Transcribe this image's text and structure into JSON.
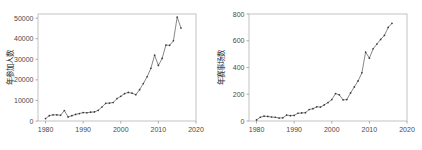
{
  "figure": {
    "background_color": "#ffffff",
    "line_color": "#555555",
    "frame_color": "#b4b4b4",
    "text_color": "#2b2b2b"
  },
  "chart_data": [
    {
      "type": "line",
      "panel": "left",
      "title": "",
      "xlabel": "",
      "ylabel": "年参加人数",
      "xlim": [
        1978,
        2020
      ],
      "ylim": [
        0,
        52000
      ],
      "xticks": [
        1980,
        1990,
        2000,
        2010,
        2020
      ],
      "yticks": [
        0,
        10000,
        20000,
        30000,
        40000,
        50000
      ],
      "xtick_labels": [
        "1980",
        "1990",
        "2000",
        "2010",
        "2020"
      ],
      "ytick_labels": [
        "0",
        "10000",
        "20000",
        "30000",
        "40000",
        "50000"
      ],
      "grid": false,
      "legend": "none",
      "markers": true,
      "x": [
        1980,
        1981,
        1982,
        1983,
        1984,
        1985,
        1986,
        1987,
        1988,
        1989,
        1990,
        1991,
        1992,
        1993,
        1994,
        1995,
        1996,
        1997,
        1998,
        1999,
        2000,
        2001,
        2002,
        2003,
        2004,
        2005,
        2006,
        2007,
        2008,
        2009,
        2010,
        2011,
        2012,
        2013,
        2014,
        2015,
        2016
      ],
      "values": [
        1200,
        2600,
        3000,
        3000,
        2800,
        5100,
        2000,
        2600,
        3200,
        3600,
        4100,
        4000,
        4300,
        4400,
        5200,
        6800,
        8600,
        8700,
        9000,
        10900,
        12000,
        13300,
        13900,
        13500,
        12800,
        15200,
        18200,
        21500,
        25600,
        32000,
        27000,
        30400,
        36900,
        36800,
        39000,
        50500,
        45200
      ]
    },
    {
      "type": "line",
      "panel": "right",
      "title": "",
      "xlabel": "",
      "ylabel": "年赛事场数",
      "xlim": [
        1978,
        2020
      ],
      "ylim": [
        0,
        800
      ],
      "xticks": [
        1980,
        1990,
        2000,
        2010,
        2020
      ],
      "yticks": [
        0,
        200,
        400,
        600,
        800
      ],
      "xtick_labels": [
        "1980",
        "1990",
        "2000",
        "2010",
        "2020"
      ],
      "ytick_labels": [
        "0",
        "200",
        "400",
        "600",
        "800"
      ],
      "grid": false,
      "legend": "none",
      "markers": true,
      "x": [
        1980,
        1981,
        1982,
        1983,
        1984,
        1985,
        1986,
        1987,
        1988,
        1989,
        1990,
        1991,
        1992,
        1993,
        1994,
        1995,
        1996,
        1997,
        1998,
        1999,
        2000,
        2001,
        2002,
        2003,
        2004,
        2005,
        2006,
        2007,
        2008,
        2009,
        2010,
        2011,
        2012,
        2013,
        2014,
        2015,
        2016
      ],
      "values": [
        8,
        28,
        36,
        34,
        30,
        28,
        22,
        24,
        44,
        40,
        42,
        58,
        60,
        62,
        86,
        92,
        106,
        104,
        120,
        138,
        160,
        205,
        196,
        158,
        160,
        210,
        255,
        300,
        360,
        515,
        470,
        540,
        575,
        610,
        640,
        700,
        730
      ]
    }
  ]
}
